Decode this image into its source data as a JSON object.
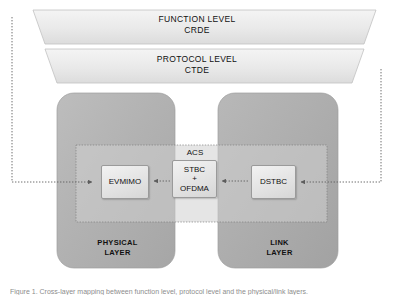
{
  "figure": {
    "caption": "Figure 1. Cross-layer mapping between function level, protocol level and the physical/link layers.",
    "background_color": "#ffffff"
  },
  "banners": [
    {
      "name": "function-level",
      "line1": "FUNCTION LEVEL",
      "line2": "CRDE",
      "fill_color": "#ececec"
    },
    {
      "name": "protocol-level",
      "line1": "PROTOCOL LEVEL",
      "line2": "CTDE",
      "fill_color": "#e6e6e6"
    }
  ],
  "layers": [
    {
      "name": "physical-layer",
      "line1": "PHYSICAL",
      "line2": "LAYER",
      "fill_color": "#b3b3b3"
    },
    {
      "name": "link-layer",
      "line1": "LINK",
      "line2": "LAYER",
      "fill_color": "#adadad"
    }
  ],
  "acs": {
    "label": "ACS",
    "fill_color": "#c9c9c9",
    "border_color": "#8e8e8e"
  },
  "nodes": [
    {
      "name": "evmimo",
      "label": "EVMIMO"
    },
    {
      "name": "stbc-ofdma",
      "line1": "STBC",
      "line2": "+",
      "line3": "OFDMA"
    },
    {
      "name": "dstbc",
      "label": "DSTBC"
    }
  ],
  "connections": [
    {
      "name": "stbc-to-evmimo",
      "direction": "left",
      "style": "dotted"
    },
    {
      "name": "dstbc-to-stbc",
      "direction": "left",
      "style": "dotted"
    },
    {
      "name": "right-feedback-to-dstbc",
      "direction": "left",
      "style": "dotted",
      "from": "protocol-level"
    },
    {
      "name": "left-feedback-to-evmimo",
      "direction": "right",
      "style": "dotted",
      "from": "function-level"
    }
  ],
  "colors": {
    "line": "#6f6f6f",
    "text": "#111111",
    "node_border": "#9a9a9a"
  }
}
